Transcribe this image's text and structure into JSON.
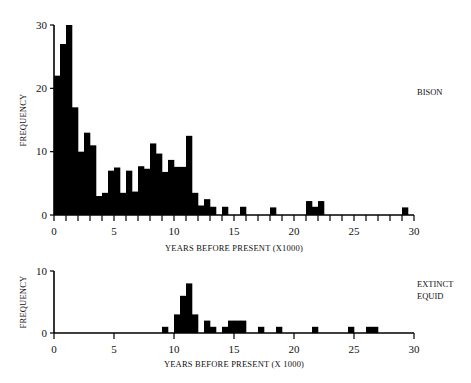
{
  "chart_data": [
    {
      "type": "bar",
      "title": "BISON",
      "xlabel": "YEARS BEFORE PRESENT (X1000)",
      "ylabel": "FREQUENCY",
      "xlim": [
        0,
        30
      ],
      "ylim": [
        0,
        30
      ],
      "bin_width": 0.5,
      "x_ticks": [
        0,
        5,
        10,
        15,
        20,
        25,
        30
      ],
      "x_tick_labels": [
        "0",
        "5",
        "10",
        "15",
        "20",
        "25",
        "30"
      ],
      "y_ticks": [
        0,
        10,
        20,
        30
      ],
      "y_tick_labels": [
        "0",
        "10",
        "20",
        "30"
      ],
      "grid": false,
      "bins": [
        {
          "x": 0.0,
          "value": 22
        },
        {
          "x": 0.5,
          "value": 27
        },
        {
          "x": 1.0,
          "value": 30
        },
        {
          "x": 1.5,
          "value": 17
        },
        {
          "x": 2.0,
          "value": 10
        },
        {
          "x": 2.5,
          "value": 13
        },
        {
          "x": 3.0,
          "value": 11
        },
        {
          "x": 3.5,
          "value": 3
        },
        {
          "x": 4.0,
          "value": 3.5
        },
        {
          "x": 4.5,
          "value": 7
        },
        {
          "x": 5.0,
          "value": 7.5
        },
        {
          "x": 5.5,
          "value": 3.5
        },
        {
          "x": 6.0,
          "value": 7
        },
        {
          "x": 6.5,
          "value": 3.7
        },
        {
          "x": 7.0,
          "value": 7.7
        },
        {
          "x": 7.5,
          "value": 7.3
        },
        {
          "x": 8.0,
          "value": 11.3
        },
        {
          "x": 8.5,
          "value": 9.7
        },
        {
          "x": 9.0,
          "value": 6.8
        },
        {
          "x": 9.5,
          "value": 8.7
        },
        {
          "x": 10.0,
          "value": 7.6
        },
        {
          "x": 10.5,
          "value": 7.6
        },
        {
          "x": 11.0,
          "value": 12.5
        },
        {
          "x": 11.5,
          "value": 3.5
        },
        {
          "x": 12.0,
          "value": 1.5
        },
        {
          "x": 12.5,
          "value": 2.5
        },
        {
          "x": 13.0,
          "value": 1.3
        },
        {
          "x": 14.0,
          "value": 1.3
        },
        {
          "x": 15.5,
          "value": 1.3
        },
        {
          "x": 18.0,
          "value": 1.2
        },
        {
          "x": 21.0,
          "value": 2.2
        },
        {
          "x": 21.5,
          "value": 1.3
        },
        {
          "x": 22.0,
          "value": 2.2
        },
        {
          "x": 29.0,
          "value": 1.2
        }
      ]
    },
    {
      "type": "bar",
      "title": "EXTINCT EQUID",
      "xlabel": "YEARS BEFORE PRESENT (X 1000)",
      "ylabel": "FREQUENCY",
      "xlim": [
        0,
        30
      ],
      "ylim": [
        0,
        10
      ],
      "bin_width": 0.5,
      "x_ticks": [
        0,
        5,
        10,
        15,
        20,
        25,
        30
      ],
      "x_tick_labels": [
        "0",
        "5",
        "10",
        "15",
        "20",
        "25",
        "30"
      ],
      "y_ticks": [
        0,
        10
      ],
      "y_tick_labels": [
        "0",
        "10"
      ],
      "grid": false,
      "bins": [
        {
          "x": 9.0,
          "value": 1
        },
        {
          "x": 10.0,
          "value": 3
        },
        {
          "x": 10.5,
          "value": 6
        },
        {
          "x": 11.0,
          "value": 8
        },
        {
          "x": 11.5,
          "value": 3
        },
        {
          "x": 12.5,
          "value": 2
        },
        {
          "x": 13.0,
          "value": 1
        },
        {
          "x": 14.0,
          "value": 1
        },
        {
          "x": 14.5,
          "value": 2
        },
        {
          "x": 15.0,
          "value": 2
        },
        {
          "x": 15.5,
          "value": 2
        },
        {
          "x": 17.0,
          "value": 1
        },
        {
          "x": 18.5,
          "value": 1
        },
        {
          "x": 21.5,
          "value": 1
        },
        {
          "x": 24.5,
          "value": 1
        },
        {
          "x": 26.0,
          "value": 1
        },
        {
          "x": 26.5,
          "value": 1
        }
      ]
    }
  ],
  "labels": {
    "bison_series": "BISON",
    "equid_series_line1": "EXTINCT",
    "equid_series_line2": "EQUID",
    "bison_xlabel": "YEARS BEFORE PRESENT (X1000)",
    "equid_xlabel": "YEARS BEFORE PRESENT (X 1000)",
    "ylabel": "FREQUENCY"
  },
  "colors": {
    "bar": "#000000",
    "axis": "#000000",
    "background": "#ffffff"
  }
}
